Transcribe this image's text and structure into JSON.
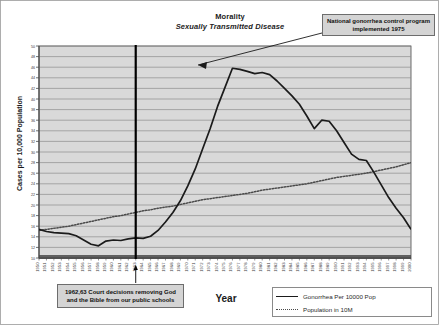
{
  "title": {
    "main": "Morality",
    "sub": "Sexually Transmitted Disease"
  },
  "axis": {
    "y_label": "Cases per 10,000 Population",
    "x_label": "Year"
  },
  "callouts": {
    "program": "National gonorrhea control program implemented 1975",
    "court": "1962,63 Court decisions removing God and the Bible from our public schools"
  },
  "legend": {
    "items": [
      {
        "label": "Gonorrhea Per 10000 Pop",
        "style": "solid",
        "color": "#1b1b1b"
      },
      {
        "label": "Population in 10M",
        "style": "dotted",
        "color": "#4a4a4a"
      }
    ]
  },
  "colors": {
    "plot_background": "#d9d9d9",
    "gridline": "#8e8e8e",
    "axis": "#4a4a4a",
    "series_gonorrhea": "#1b1b1b",
    "series_population": "#4a4a4a",
    "event_line": "#000000",
    "callout_fill": "#d4d4d4",
    "callout_border": "#6d6d6d",
    "page_background": "#ffffff"
  },
  "chart_data": {
    "type": "line",
    "xlabel": "Year",
    "ylabel": "Cases per 10,000 Population",
    "ylim": [
      10,
      50
    ],
    "ytick_step": 2,
    "yticks": [
      10,
      12,
      14,
      16,
      18,
      20,
      22,
      24,
      26,
      28,
      30,
      32,
      34,
      36,
      38,
      40,
      42,
      44,
      46,
      48,
      50
    ],
    "grid": true,
    "legend_position": "bottom-right",
    "x": [
      1950,
      1951,
      1952,
      1953,
      1954,
      1955,
      1956,
      1957,
      1958,
      1959,
      1960,
      1961,
      1962,
      1963,
      1964,
      1965,
      1966,
      1967,
      1968,
      1969,
      1970,
      1971,
      1972,
      1973,
      1974,
      1975,
      1976,
      1977,
      1978,
      1979,
      1980,
      1981,
      1982,
      1983,
      1984,
      1985,
      1986,
      1987,
      1988,
      1989,
      1990,
      1991,
      1992,
      1993,
      1994,
      1995,
      1996,
      1997,
      1998,
      1999,
      2000
    ],
    "xtick_labels": [
      "1950",
      "1951",
      "1952",
      "1953",
      "1954",
      "1955",
      "1956",
      "1957",
      "1958",
      "1959",
      "1960",
      "1961",
      "1962",
      "1963",
      "1964",
      "1965",
      "1966",
      "1967",
      "1968",
      "1969",
      "1970",
      "1971",
      "1972",
      "1973",
      "1974",
      "1975",
      "1976",
      "1977",
      "1978",
      "1979",
      "1980",
      "1981",
      "1982",
      "1983",
      "1984",
      "1985",
      "1986",
      "1987",
      "1988",
      "1989",
      "1990",
      "1991",
      "1992",
      "1993",
      "1994",
      "1995",
      "1996",
      "1997",
      "1998",
      "1999",
      "2000"
    ],
    "series": [
      {
        "name": "Gonorrhea Per 10000 Pop",
        "style": "solid",
        "color": "#1b1b1b",
        "values": [
          15.4,
          15.0,
          14.8,
          14.7,
          14.6,
          14.2,
          13.4,
          12.6,
          12.3,
          13.2,
          13.4,
          13.3,
          13.6,
          13.8,
          13.7,
          14.1,
          15.2,
          16.8,
          18.6,
          20.8,
          23.6,
          26.8,
          30.6,
          34.4,
          38.6,
          42.2,
          45.8,
          45.6,
          45.2,
          44.8,
          45.0,
          44.6,
          43.4,
          42.0,
          40.6,
          39.0,
          36.8,
          34.4,
          36.0,
          35.8,
          34.0,
          31.8,
          29.6,
          28.6,
          28.4,
          26.2,
          23.8,
          21.4,
          19.4,
          17.6,
          15.4
        ]
      },
      {
        "name": "Population in 10M",
        "style": "dotted",
        "color": "#4a4a4a",
        "values": [
          15.2,
          15.4,
          15.6,
          15.8,
          16.0,
          16.3,
          16.6,
          16.9,
          17.2,
          17.5,
          17.8,
          18.0,
          18.3,
          18.6,
          18.9,
          19.1,
          19.4,
          19.6,
          19.8,
          20.1,
          20.4,
          20.7,
          21.0,
          21.2,
          21.4,
          21.6,
          21.8,
          22.0,
          22.2,
          22.5,
          22.8,
          23.0,
          23.2,
          23.4,
          23.6,
          23.8,
          24.0,
          24.3,
          24.6,
          24.9,
          25.2,
          25.4,
          25.6,
          25.8,
          26.0,
          26.3,
          26.6,
          26.9,
          27.2,
          27.6,
          28.0
        ]
      }
    ],
    "annotations": [
      {
        "name": "court-decisions-event-line",
        "type": "vline",
        "x": 1963,
        "text": "1962,63 Court decisions removing God and the Bible from our public schools"
      },
      {
        "name": "gonorrhea-program-callout",
        "type": "arrow",
        "x": 1976,
        "y": 45.8,
        "text": "National gonorrhea control program implemented 1975"
      }
    ]
  }
}
